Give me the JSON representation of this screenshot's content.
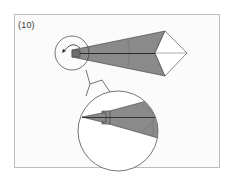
{
  "diagram": {
    "step_label": "(10)",
    "colors": {
      "frame_border": "#bdbdbd",
      "background": "#fbfbfb",
      "paper_shaded": "#8a8a8a",
      "paper_white": "#ffffff",
      "line": "#3a3a3a",
      "center_crease": "#2a2a2a"
    },
    "elements": [
      {
        "name": "step-number",
        "text": "(10)"
      },
      {
        "name": "kite-model",
        "description": "Folded kite-base model, shaded long point to the left, white diamond flap at right"
      },
      {
        "name": "detail-circle-small",
        "description": "Circle highlighting left tip with curved fold arrow"
      },
      {
        "name": "fold-arrow",
        "description": "Curved arrow indicating inside-reverse fold of tip"
      },
      {
        "name": "detail-circle-large",
        "description": "Magnified view of the left tip showing the result of the fold"
      }
    ]
  }
}
